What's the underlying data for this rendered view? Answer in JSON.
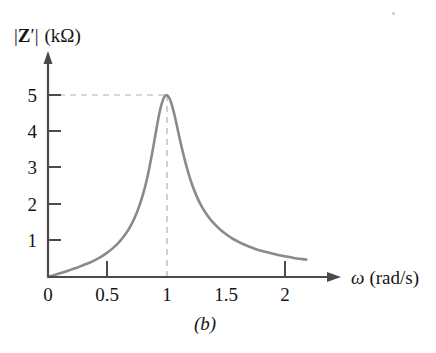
{
  "figure": {
    "caption": "(b)",
    "y_axis_label_parts": {
      "bar_left": "|",
      "symbol": "Z",
      "prime": "′",
      "bar_right": "|",
      "unit": "(kΩ)"
    },
    "y_axis_label_full": "|Z′| (kΩ)",
    "x_axis_label_parts": {
      "symbol": "ω",
      "unit": "(rad/s)"
    },
    "x_axis_label_full": "ω (rad/s)",
    "colors": {
      "curve": "#8a8a8a",
      "axis": "#4a4a4a",
      "dashed": "#b0b0b0",
      "text": "#141414",
      "background": "#ffffff"
    }
  },
  "chart_data": {
    "type": "line",
    "title": "",
    "subtitle": "",
    "caption": "(b)",
    "xlabel": "ω (rad/s)",
    "ylabel": "|Z′| (kΩ)",
    "xlim": [
      0,
      2.35
    ],
    "ylim": [
      0,
      5.6
    ],
    "xticks": [
      0,
      0.5,
      1,
      1.5,
      2
    ],
    "xtick_labels": [
      "0",
      "0.5",
      "1",
      "1.5",
      "2"
    ],
    "yticks": [
      1,
      2,
      3,
      4,
      5
    ],
    "ytick_labels": [
      "1",
      "2",
      "3",
      "4",
      "5"
    ],
    "grid": false,
    "legend": null,
    "annotations": [
      {
        "type": "dashed-horizontal",
        "y": 5,
        "from_x": 0,
        "to_x": 1,
        "label": "peak level 5 kΩ"
      },
      {
        "type": "dashed-vertical",
        "x": 1,
        "from_y": 0,
        "to_y": 5,
        "label": "resonant frequency ω = 1 rad/s"
      }
    ],
    "peak": {
      "x": 1,
      "y": 5
    },
    "series": [
      {
        "name": "|Z'|",
        "x": [
          0.0,
          0.05,
          0.1,
          0.15,
          0.2,
          0.25,
          0.3,
          0.35,
          0.4,
          0.45,
          0.5,
          0.55,
          0.6,
          0.65,
          0.7,
          0.75,
          0.8,
          0.84,
          0.88,
          0.9,
          0.92,
          0.94,
          0.96,
          0.98,
          1.0,
          1.02,
          1.04,
          1.06,
          1.08,
          1.1,
          1.14,
          1.18,
          1.22,
          1.26,
          1.3,
          1.35,
          1.4,
          1.45,
          1.5,
          1.55,
          1.6,
          1.65,
          1.7,
          1.75,
          1.8,
          1.85,
          1.9,
          1.95,
          2.0,
          2.05,
          2.1,
          2.15,
          2.18
        ],
        "y": [
          0.0,
          0.05,
          0.1,
          0.15,
          0.21,
          0.26,
          0.33,
          0.39,
          0.47,
          0.56,
          0.67,
          0.8,
          0.96,
          1.16,
          1.42,
          1.77,
          2.25,
          2.76,
          3.42,
          3.79,
          4.16,
          4.5,
          4.76,
          4.94,
          5.0,
          4.94,
          4.78,
          4.55,
          4.27,
          3.97,
          3.4,
          2.91,
          2.5,
          2.18,
          1.92,
          1.67,
          1.47,
          1.31,
          1.18,
          1.07,
          0.98,
          0.9,
          0.83,
          0.77,
          0.72,
          0.68,
          0.64,
          0.6,
          0.57,
          0.54,
          0.51,
          0.49,
          0.48
        ]
      }
    ]
  }
}
